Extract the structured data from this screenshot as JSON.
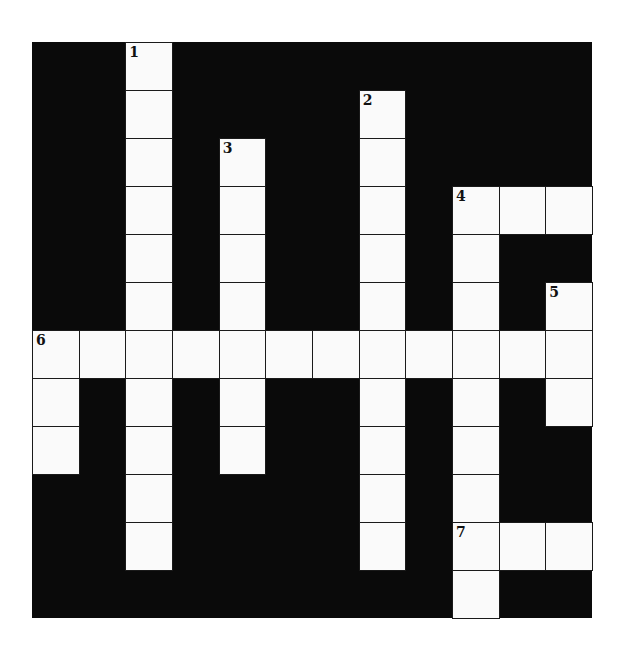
{
  "puzzle": {
    "rows": 12,
    "cols": 12,
    "colors": {
      "block": "#0a0a0a",
      "cell": "#fafafa",
      "line": "#1a1a1a"
    },
    "entries": [
      {
        "number": "1",
        "direction": "down",
        "row": 0,
        "col": 2,
        "length": 11
      },
      {
        "number": "2",
        "direction": "down",
        "row": 1,
        "col": 7,
        "length": 10
      },
      {
        "number": "3",
        "direction": "down",
        "row": 2,
        "col": 4,
        "length": 7
      },
      {
        "number": "4",
        "direction": "across",
        "row": 3,
        "col": 9,
        "length": 3
      },
      {
        "number": "4",
        "direction": "down",
        "row": 3,
        "col": 9,
        "length": 9
      },
      {
        "number": "5",
        "direction": "down",
        "row": 5,
        "col": 11,
        "length": 3
      },
      {
        "number": "6",
        "direction": "across",
        "row": 6,
        "col": 0,
        "length": 12
      },
      {
        "number": "6",
        "direction": "down",
        "row": 6,
        "col": 0,
        "length": 3
      },
      {
        "number": "7",
        "direction": "across",
        "row": 10,
        "col": 9,
        "length": 3
      }
    ],
    "numbers": [
      {
        "label": "1",
        "row": 0,
        "col": 2
      },
      {
        "label": "2",
        "row": 1,
        "col": 7
      },
      {
        "label": "3",
        "row": 2,
        "col": 4
      },
      {
        "label": "4",
        "row": 3,
        "col": 9
      },
      {
        "label": "5",
        "row": 5,
        "col": 11
      },
      {
        "label": "6",
        "row": 6,
        "col": 0
      },
      {
        "label": "7",
        "row": 10,
        "col": 9
      }
    ]
  }
}
